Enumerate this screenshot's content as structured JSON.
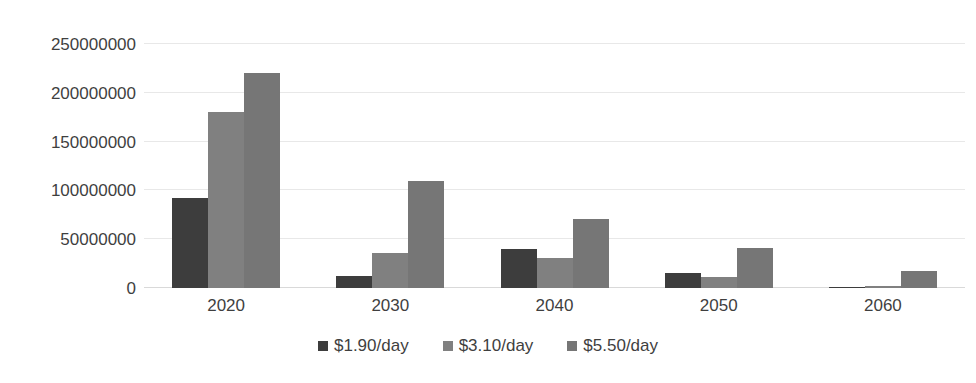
{
  "chart_data": {
    "type": "bar",
    "title": "",
    "subtitle": "",
    "xlabel": "",
    "ylabel": "",
    "categories": [
      "2020",
      "2030",
      "2040",
      "2050",
      "2060"
    ],
    "series": [
      {
        "name": "$1.90/day",
        "color": "#3d3d3d",
        "values": [
          92000000,
          12000000,
          40000000,
          15000000,
          1000000
        ]
      },
      {
        "name": "$3.10/day",
        "color": "#808080",
        "values": [
          180000000,
          36000000,
          31000000,
          11000000,
          2000000
        ]
      },
      {
        "name": "$5.50/day",
        "color": "#767676",
        "values": [
          220000000,
          110000000,
          71000000,
          41000000,
          17000000
        ]
      }
    ],
    "ylim": [
      0,
      250000000
    ],
    "ytick_values": [
      0,
      50000000,
      100000000,
      150000000,
      200000000,
      250000000
    ],
    "ytick_labels": [
      "0",
      "50000000",
      "100000000",
      "150000000",
      "200000000",
      "250000000"
    ],
    "grid": true,
    "grid_axis": "y",
    "legend_position": "bottom",
    "background_color": "#ffffff",
    "gridline_color": "#e8e8e8",
    "text_color": "#3f3f3f"
  }
}
